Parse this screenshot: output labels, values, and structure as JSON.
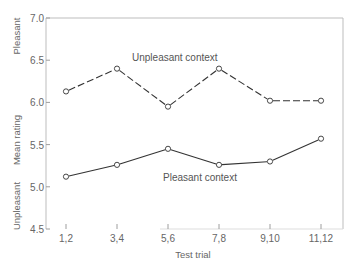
{
  "chart_data": {
    "type": "line",
    "title": "",
    "xlabel": "Test trial",
    "ylabel": "Mean rating",
    "ylabel_top": "Pleasant",
    "ylabel_bottom": "Unpleasant",
    "categories": [
      "1,2",
      "3,4",
      "5,6",
      "7,8",
      "9,10",
      "11,12"
    ],
    "ylim": [
      4.5,
      7.0
    ],
    "yticks": [
      "4.5",
      "5.0",
      "5.5",
      "6.0",
      "6.5",
      "7.0"
    ],
    "grid": false,
    "legend": "inline labels",
    "series": [
      {
        "name": "Unpleasant context",
        "style": "dashed",
        "marker": "open-circle",
        "values": [
          6.13,
          6.4,
          5.95,
          6.4,
          6.02,
          6.02
        ]
      },
      {
        "name": "Pleasant context",
        "style": "solid",
        "marker": "open-circle",
        "values": [
          5.12,
          5.26,
          5.45,
          5.26,
          5.3,
          5.57
        ]
      }
    ]
  },
  "colors": {
    "line": "#333333",
    "frame": "#bdbdbd",
    "text": "#666666"
  }
}
